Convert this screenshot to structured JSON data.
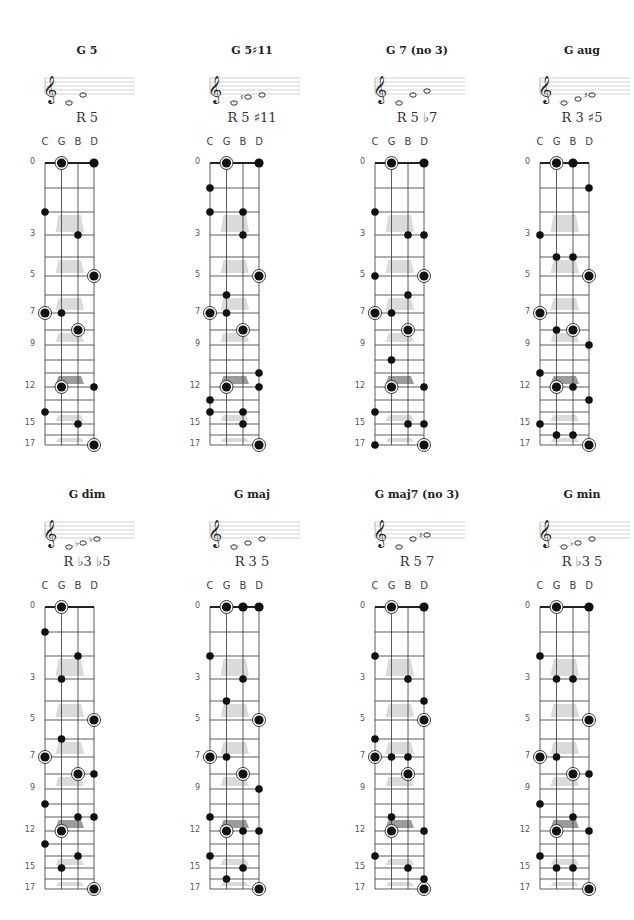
{
  "strings": [
    "C",
    "G",
    "B",
    "D"
  ],
  "fret_markers": [
    "0",
    "3",
    "5",
    "7",
    "9",
    "12",
    "15",
    "17"
  ],
  "colors": {
    "dot": "#111111",
    "line": "#333333",
    "inlay": "#d6d6d6",
    "inlay_12": "#8a8a8a"
  },
  "chart_data": [
    {
      "title": "G 5",
      "formula": "R 5",
      "notes": [
        "G",
        "D"
      ],
      "dots": [
        [
          "G",
          0,
          1
        ],
        [
          "D",
          0,
          0
        ],
        [
          "C",
          2,
          0
        ],
        [
          "B",
          3,
          0
        ],
        [
          "D",
          5,
          1
        ],
        [
          "C",
          7,
          1
        ],
        [
          "G",
          7,
          0
        ],
        [
          "B",
          8,
          1
        ],
        [
          "G",
          12,
          1
        ],
        [
          "D",
          12,
          0
        ],
        [
          "C",
          14,
          0
        ],
        [
          "B",
          15,
          0
        ],
        [
          "D",
          17,
          1
        ]
      ]
    },
    {
      "title": "G 5♯11",
      "formula": "R 5 ♯11",
      "notes": [
        "G",
        "C♯",
        "D"
      ],
      "dots": [
        [
          "G",
          0,
          1
        ],
        [
          "D",
          0,
          0
        ],
        [
          "C",
          1,
          0
        ],
        [
          "C",
          2,
          0
        ],
        [
          "B",
          2,
          0
        ],
        [
          "B",
          3,
          0
        ],
        [
          "D",
          5,
          1
        ],
        [
          "G",
          6,
          0
        ],
        [
          "C",
          7,
          1
        ],
        [
          "G",
          7,
          0
        ],
        [
          "B",
          8,
          1
        ],
        [
          "D",
          11,
          0
        ],
        [
          "G",
          12,
          1
        ],
        [
          "D",
          12,
          0
        ],
        [
          "C",
          13,
          0
        ],
        [
          "C",
          14,
          0
        ],
        [
          "B",
          14,
          0
        ],
        [
          "B",
          15,
          0
        ],
        [
          "D",
          17,
          1
        ]
      ]
    },
    {
      "title": "G 7 (no 3)",
      "formula": "R 5 ♭7",
      "notes": [
        "G",
        "D",
        "F"
      ],
      "dots": [
        [
          "G",
          0,
          1
        ],
        [
          "D",
          0,
          0
        ],
        [
          "C",
          2,
          0
        ],
        [
          "B",
          3,
          0
        ],
        [
          "D",
          3,
          0
        ],
        [
          "C",
          5,
          0
        ],
        [
          "D",
          5,
          1
        ],
        [
          "B",
          6,
          0
        ],
        [
          "C",
          7,
          1
        ],
        [
          "G",
          7,
          0
        ],
        [
          "B",
          8,
          1
        ],
        [
          "G",
          10,
          0
        ],
        [
          "G",
          12,
          1
        ],
        [
          "D",
          12,
          0
        ],
        [
          "C",
          14,
          0
        ],
        [
          "B",
          15,
          0
        ],
        [
          "D",
          15,
          0
        ],
        [
          "C",
          17,
          0
        ],
        [
          "D",
          17,
          1
        ]
      ]
    },
    {
      "title": "G aug",
      "formula": "R 3 ♯5",
      "notes": [
        "G",
        "B",
        "D♯"
      ],
      "dots": [
        [
          "G",
          0,
          1
        ],
        [
          "B",
          0,
          0
        ],
        [
          "D",
          1,
          0
        ],
        [
          "C",
          3,
          0
        ],
        [
          "G",
          4,
          0
        ],
        [
          "B",
          4,
          0
        ],
        [
          "D",
          5,
          1
        ],
        [
          "C",
          7,
          1
        ],
        [
          "G",
          8,
          0
        ],
        [
          "B",
          8,
          1
        ],
        [
          "D",
          9,
          0
        ],
        [
          "C",
          11,
          0
        ],
        [
          "G",
          12,
          1
        ],
        [
          "B",
          12,
          0
        ],
        [
          "D",
          13,
          0
        ],
        [
          "C",
          15,
          0
        ],
        [
          "G",
          16,
          0
        ],
        [
          "B",
          16,
          0
        ],
        [
          "D",
          17,
          1
        ]
      ]
    },
    {
      "title": "G dim",
      "formula": "R ♭3 ♭5",
      "notes": [
        "G",
        "B♭",
        "D♭"
      ],
      "dots": [
        [
          "G",
          0,
          1
        ],
        [
          "C",
          1,
          0
        ],
        [
          "B",
          2,
          0
        ],
        [
          "G",
          3,
          0
        ],
        [
          "D",
          5,
          1
        ],
        [
          "G",
          6,
          0
        ],
        [
          "C",
          7,
          1
        ],
        [
          "B",
          8,
          1
        ],
        [
          "D",
          8,
          0
        ],
        [
          "C",
          10,
          0
        ],
        [
          "B",
          11,
          0
        ],
        [
          "D",
          11,
          0
        ],
        [
          "G",
          12,
          1
        ],
        [
          "C",
          13,
          0
        ],
        [
          "B",
          14,
          0
        ],
        [
          "G",
          15,
          0
        ],
        [
          "D",
          17,
          1
        ]
      ]
    },
    {
      "title": "G maj",
      "formula": "R 3 5",
      "notes": [
        "G",
        "B",
        "D"
      ],
      "dots": [
        [
          "G",
          0,
          1
        ],
        [
          "B",
          0,
          0
        ],
        [
          "D",
          0,
          0
        ],
        [
          "C",
          2,
          0
        ],
        [
          "B",
          3,
          0
        ],
        [
          "G",
          4,
          0
        ],
        [
          "D",
          5,
          1
        ],
        [
          "C",
          7,
          1
        ],
        [
          "G",
          7,
          0
        ],
        [
          "B",
          8,
          1
        ],
        [
          "D",
          9,
          0
        ],
        [
          "C",
          11,
          0
        ],
        [
          "G",
          12,
          1
        ],
        [
          "B",
          12,
          0
        ],
        [
          "D",
          12,
          0
        ],
        [
          "C",
          14,
          0
        ],
        [
          "B",
          15,
          0
        ],
        [
          "G",
          16,
          0
        ],
        [
          "D",
          17,
          1
        ]
      ]
    },
    {
      "title": "G maj7 (no 3)",
      "formula": "R 5 7",
      "notes": [
        "G",
        "D",
        "F♯"
      ],
      "dots": [
        [
          "G",
          0,
          1
        ],
        [
          "D",
          0,
          0
        ],
        [
          "C",
          2,
          0
        ],
        [
          "B",
          3,
          0
        ],
        [
          "D",
          4,
          0
        ],
        [
          "D",
          5,
          1
        ],
        [
          "C",
          6,
          0
        ],
        [
          "C",
          7,
          1
        ],
        [
          "G",
          7,
          0
        ],
        [
          "B",
          7,
          0
        ],
        [
          "B",
          8,
          1
        ],
        [
          "G",
          11,
          0
        ],
        [
          "G",
          12,
          1
        ],
        [
          "D",
          12,
          0
        ],
        [
          "C",
          14,
          0
        ],
        [
          "B",
          15,
          0
        ],
        [
          "D",
          16,
          0
        ],
        [
          "D",
          17,
          1
        ]
      ]
    },
    {
      "title": "G min",
      "formula": "R ♭3 5",
      "notes": [
        "G",
        "B♭",
        "D"
      ],
      "dots": [
        [
          "G",
          0,
          1
        ],
        [
          "D",
          0,
          0
        ],
        [
          "C",
          2,
          0
        ],
        [
          "G",
          3,
          0
        ],
        [
          "B",
          3,
          0
        ],
        [
          "D",
          5,
          1
        ],
        [
          "C",
          7,
          1
        ],
        [
          "G",
          7,
          0
        ],
        [
          "B",
          8,
          1
        ],
        [
          "D",
          8,
          0
        ],
        [
          "C",
          10,
          0
        ],
        [
          "B",
          11,
          0
        ],
        [
          "G",
          12,
          1
        ],
        [
          "D",
          12,
          0
        ],
        [
          "C",
          14,
          0
        ],
        [
          "G",
          15,
          0
        ],
        [
          "B",
          15,
          0
        ],
        [
          "D",
          17,
          1
        ]
      ]
    }
  ]
}
